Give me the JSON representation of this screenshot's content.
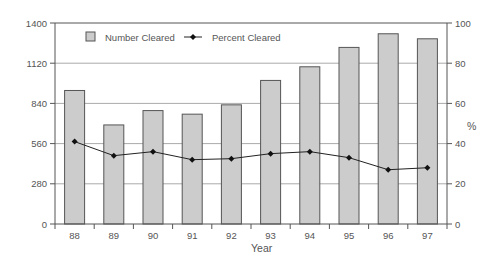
{
  "chart_data": {
    "type": "bar",
    "title": "",
    "xlabel": "Year",
    "ylabel": "",
    "y2label": "%",
    "categories": [
      "88",
      "89",
      "90",
      "91",
      "92",
      "93",
      "94",
      "95",
      "96",
      "97"
    ],
    "series": [
      {
        "name": "Number Cleared",
        "type": "bar",
        "axis": "left",
        "values": [
          930,
          690,
          790,
          765,
          830,
          1000,
          1095,
          1230,
          1325,
          1290
        ]
      },
      {
        "name": "Percent Cleared",
        "type": "line",
        "axis": "right",
        "values": [
          41,
          34,
          36,
          32,
          32.5,
          35,
          36,
          33,
          27,
          28
        ]
      }
    ],
    "ylim": [
      0,
      1400
    ],
    "y2lim": [
      0,
      100
    ],
    "yticks": [
      0,
      280,
      560,
      840,
      1120,
      1400
    ],
    "y2ticks": [
      0,
      20,
      40,
      60,
      80,
      100
    ],
    "grid": true,
    "legend_position": "top-left inside"
  },
  "legend": {
    "bar_label": "Number Cleared",
    "line_label": "Percent Cleared"
  },
  "axes": {
    "x_title": "Year",
    "y2_title": "%",
    "left_ticks": [
      "0",
      "280",
      "560",
      "840",
      "1120",
      "1400"
    ],
    "right_ticks": [
      "0",
      "20",
      "40",
      "60",
      "80",
      "100"
    ]
  },
  "colors": {
    "bar_fill": "#cccccc",
    "bar_stroke": "#555555",
    "line": "#222222",
    "grid": "#aaaaaa",
    "axis": "#555555"
  }
}
